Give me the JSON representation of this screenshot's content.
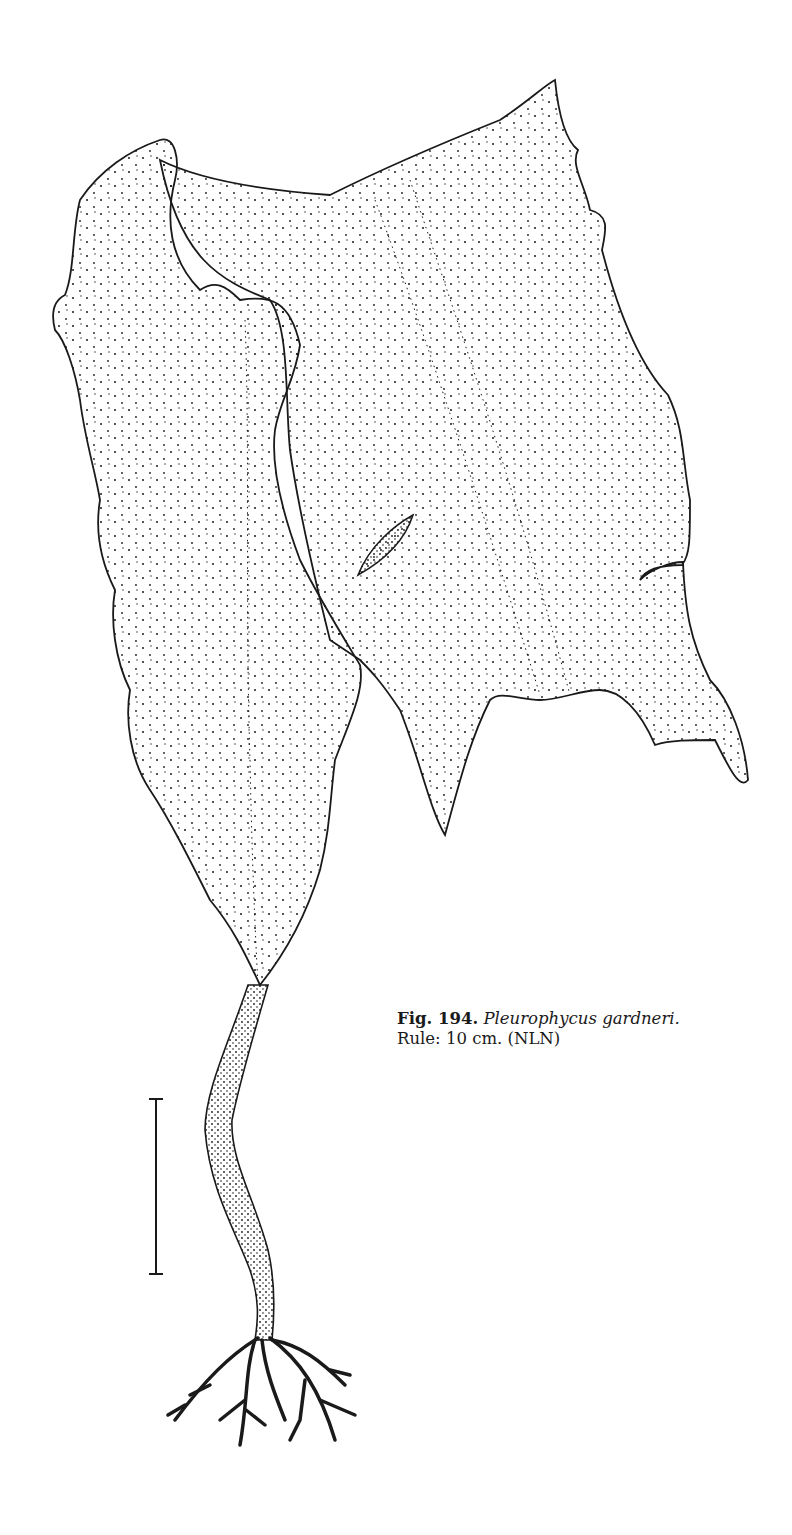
{
  "figure": {
    "number_label": "Fig. 194.",
    "species_name": "Pleurophycus gardneri.",
    "rule_text": "Rule: 10 cm. (NLN)"
  },
  "illustration": {
    "subject": "kelp thallus with blade, stipe and branched holdfast",
    "ink_color": "#1a1a1a",
    "paper_color": "#ffffff"
  },
  "scale_bar": {
    "length_label": "10 cm",
    "x": 156,
    "y_top": 1099,
    "y_bottom": 1274
  }
}
